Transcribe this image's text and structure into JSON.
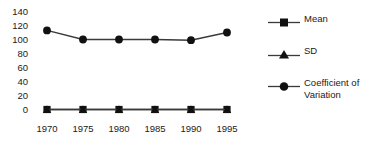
{
  "chart_data": {
    "type": "line",
    "title": "",
    "subtitle": "",
    "xlabel": "",
    "ylabel": "",
    "categories": [
      "1970",
      "1975",
      "1980",
      "1985",
      "1990",
      "1995"
    ],
    "x": [
      1970,
      1975,
      1980,
      1985,
      1990,
      1995
    ],
    "series": [
      {
        "name": "Mean",
        "marker": "square",
        "color": "#000000",
        "values": [
          0,
          0,
          0,
          0,
          0,
          0
        ]
      },
      {
        "name": "SD",
        "marker": "triangle",
        "color": "#000000",
        "values": [
          0,
          0,
          0,
          0,
          0,
          0
        ]
      },
      {
        "name": "Coefficient of Variation",
        "marker": "circle",
        "color": "#000000",
        "values": [
          113,
          100,
          100,
          100,
          99,
          110
        ]
      }
    ],
    "ylim": [
      0,
      140
    ],
    "ytick_values": [
      0,
      20,
      40,
      60,
      80,
      100,
      120,
      140
    ],
    "ytick_labels": [
      "0",
      "20",
      "40",
      "60",
      "80",
      "100",
      "120",
      "140"
    ],
    "xtick_labels": [
      "1970",
      "1975",
      "1980",
      "1985",
      "1990",
      "1995"
    ],
    "grid": false,
    "axis_lines": false,
    "legend_position": "right",
    "legend_entries": [
      "Mean",
      "SD",
      "Coefficient of Variation"
    ],
    "annotations": []
  },
  "axis": {
    "y_labels": [
      "140",
      "120",
      "100",
      "80",
      "60",
      "40",
      "20",
      "0"
    ],
    "x_labels": [
      "1970",
      "1975",
      "1980",
      "1985",
      "1990",
      "1995"
    ]
  },
  "legend": {
    "items": [
      {
        "label": "Mean",
        "marker": "square"
      },
      {
        "label": "SD",
        "marker": "triangle"
      },
      {
        "label": "Coefficient of Variation",
        "marker": "circle"
      }
    ]
  },
  "colors": {
    "background": "#ffffff",
    "foreground": "#000000",
    "text": "#1a1a1a",
    "line": "#3a3a3a"
  }
}
